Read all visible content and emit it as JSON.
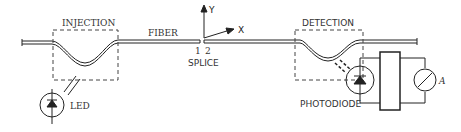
{
  "diagram": {
    "labels": {
      "injection": "INJECTION",
      "fiber": "FIBER",
      "splice_1": "1",
      "splice_2": "2",
      "splice": "SPLICE",
      "axis_y": "Y",
      "axis_x": "X",
      "detection": "DETECTION",
      "led": "LED",
      "photodiode": "PHOTODIODE",
      "ammeter": "A"
    },
    "colors": {
      "line": "#222222",
      "dash": "#444444",
      "text": "#333333",
      "background": "#ffffff"
    }
  }
}
